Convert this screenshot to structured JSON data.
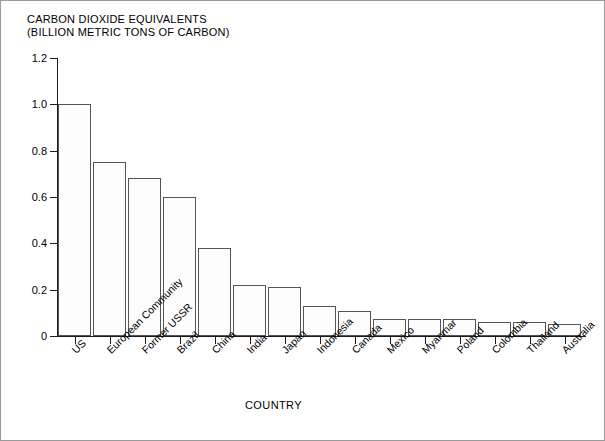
{
  "chart_data": {
    "type": "bar",
    "title": "CARBON DIOXIDE EQUIVALENTS",
    "subtitle": "(BILLION METRIC TONS OF CARBON)",
    "xlabel": "COUNTRY",
    "ylabel": "",
    "ylim": [
      0,
      1.2
    ],
    "yticks": [
      0,
      0.2,
      0.4,
      0.6,
      0.8,
      1.0,
      1.2
    ],
    "ytick_labels": [
      "0",
      "0.2",
      "0.4",
      "0.6",
      "0.8",
      "1.0",
      "1.2"
    ],
    "grid": false,
    "legend": null,
    "categories": [
      "US",
      "European Community",
      "Former USSR",
      "Brazil",
      "China",
      "India",
      "Japan",
      "Indonesia",
      "Canada",
      "Mexico",
      "Myanmar",
      "Poland",
      "Colombia",
      "Thailand",
      "Australia"
    ],
    "values": [
      1.0,
      0.75,
      0.68,
      0.6,
      0.38,
      0.22,
      0.21,
      0.13,
      0.11,
      0.073,
      0.073,
      0.073,
      0.062,
      0.06,
      0.05
    ]
  },
  "style": {
    "bar_fill": "#fdfdfd",
    "bar_dot": "#9b9b9b",
    "bar_border": "#555555",
    "axis_color": "#1a1a1a",
    "frame_color": "#9a9a9a",
    "background": "#ffffff"
  }
}
